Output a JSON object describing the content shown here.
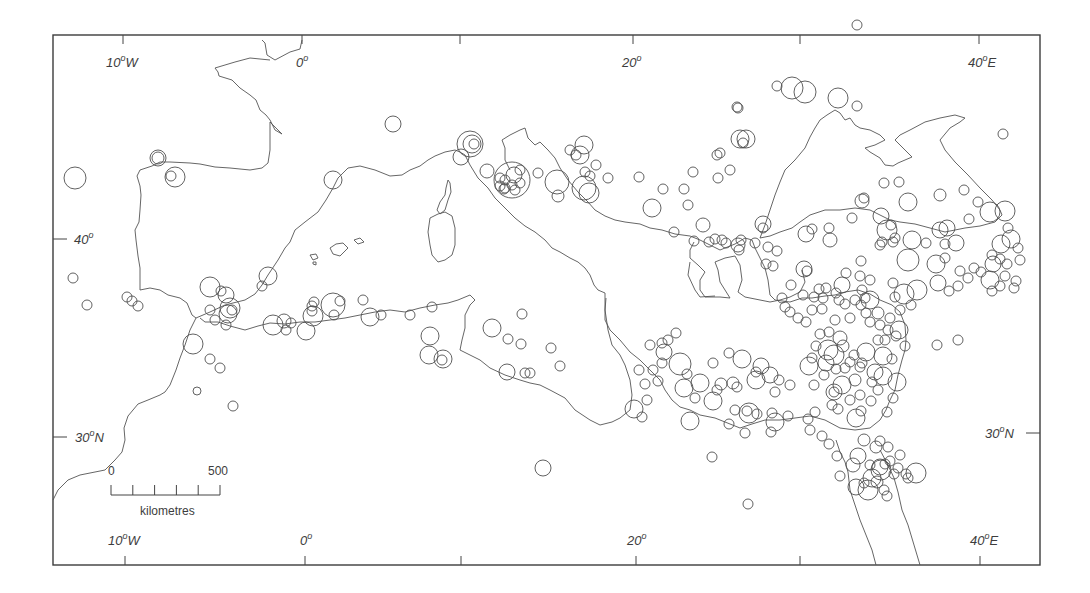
{
  "map": {
    "type": "proportional-symbol map",
    "region": "Mediterranean basin",
    "frame": {
      "x0": 53,
      "y0": 35,
      "x1": 1040,
      "y1": 565
    },
    "longitude_labels_top": [
      {
        "text": "10",
        "suffix": "W",
        "x": 118,
        "tick_x": 123
      },
      {
        "text": "0",
        "suffix": "",
        "x": 298,
        "tick_x": 302
      },
      {
        "text": "",
        "suffix": "",
        "x": 460,
        "tick_x": 460
      },
      {
        "text": "20",
        "suffix": "",
        "x": 625,
        "tick_x": 633
      },
      {
        "text": "",
        "suffix": "",
        "x": 800,
        "tick_x": 800
      },
      {
        "text": "40",
        "suffix": "E",
        "x": 970,
        "tick_x": 979
      }
    ],
    "longitude_labels_bottom": [
      {
        "text": "10",
        "suffix": "W",
        "x": 108,
        "tick_x": 125
      },
      {
        "text": "0",
        "suffix": "",
        "x": 302,
        "tick_x": 305
      },
      {
        "text": "",
        "suffix": "",
        "x": 461,
        "tick_x": 461
      },
      {
        "text": "20",
        "suffix": "",
        "x": 630,
        "tick_x": 636
      },
      {
        "text": "",
        "suffix": "",
        "x": 800,
        "tick_x": 800
      },
      {
        "text": "40",
        "suffix": "E",
        "x": 970,
        "tick_x": 980
      }
    ],
    "latitude_labels_left": [
      {
        "text": "40",
        "suffix": "",
        "y": 239
      },
      {
        "text": "30",
        "suffix": "N",
        "y": 437
      }
    ],
    "latitude_labels_right": [
      {
        "text": "30",
        "suffix": "N",
        "y": 433
      }
    ],
    "degree_symbol": "o",
    "scale_bar": {
      "start_label": "0",
      "end_label": "500",
      "unit_label": "kilometres",
      "x0": 111,
      "x1": 220,
      "y": 495,
      "divisions": 5
    }
  },
  "labels": {
    "top_10w": "10",
    "top_0": "0",
    "top_20": "20",
    "top_40e": "40",
    "bottom_10w": "10",
    "bottom_0": "0",
    "bottom_20": "20",
    "bottom_40e": "40",
    "left_40": "40",
    "left_30n": "30",
    "right_30n": "30",
    "deg": "o",
    "W": "W",
    "E": "E",
    "N": "N",
    "scale_0": "0",
    "scale_500": "500",
    "scale_unit": "kilometres"
  },
  "sites": [
    [
      75,
      178,
      11
    ],
    [
      158,
      158,
      8
    ],
    [
      158,
      158,
      6
    ],
    [
      175,
      177,
      10
    ],
    [
      171,
      176,
      5
    ],
    [
      73,
      278,
      5
    ],
    [
      87,
      305,
      5
    ],
    [
      127,
      297,
      5
    ],
    [
      132,
      301,
      5
    ],
    [
      138,
      306,
      5
    ],
    [
      210,
      287,
      10
    ],
    [
      221,
      291,
      5
    ],
    [
      226,
      295,
      8
    ],
    [
      230,
      308,
      10
    ],
    [
      228,
      314,
      9
    ],
    [
      232,
      310,
      5
    ],
    [
      210,
      310,
      5
    ],
    [
      215,
      320,
      5
    ],
    [
      226,
      325,
      5
    ],
    [
      193,
      344,
      10
    ],
    [
      210,
      359,
      5
    ],
    [
      220,
      368,
      5
    ],
    [
      197,
      391,
      4
    ],
    [
      233,
      406,
      5
    ],
    [
      268,
      276,
      9
    ],
    [
      262,
      286,
      5
    ],
    [
      273,
      325,
      10
    ],
    [
      284,
      321,
      7
    ],
    [
      291,
      323,
      5
    ],
    [
      286,
      330,
      5
    ],
    [
      313,
      316,
      10
    ],
    [
      314,
      302,
      5
    ],
    [
      312,
      306,
      5
    ],
    [
      312,
      311,
      5
    ],
    [
      306,
      331,
      9
    ],
    [
      333,
      305,
      12
    ],
    [
      334,
      315,
      5
    ],
    [
      340,
      301,
      5
    ],
    [
      363,
      300,
      5
    ],
    [
      370,
      317,
      9
    ],
    [
      381,
      315,
      5
    ],
    [
      410,
      315,
      5
    ],
    [
      432,
      307,
      5
    ],
    [
      430,
      336,
      9
    ],
    [
      429,
      355,
      9
    ],
    [
      443,
      359,
      9
    ],
    [
      442,
      360,
      5
    ],
    [
      492,
      328,
      9
    ],
    [
      508,
      339,
      5
    ],
    [
      522,
      314,
      5
    ],
    [
      521,
      344,
      5
    ],
    [
      507,
      372,
      8
    ],
    [
      525,
      373,
      5
    ],
    [
      530,
      373,
      5
    ],
    [
      551,
      348,
      5
    ],
    [
      560,
      366,
      5
    ],
    [
      543,
      468,
      8
    ],
    [
      712,
      457,
      5
    ],
    [
      748,
      504,
      5
    ],
    [
      393,
      124,
      8
    ],
    [
      333,
      180,
      9
    ],
    [
      461,
      157,
      8
    ],
    [
      470,
      144,
      13
    ],
    [
      472,
      144,
      9
    ],
    [
      474,
      144,
      5
    ],
    [
      512,
      180,
      18
    ],
    [
      514,
      175,
      8
    ],
    [
      520,
      170,
      5
    ],
    [
      500,
      178,
      5
    ],
    [
      505,
      180,
      5
    ],
    [
      512,
      185,
      5
    ],
    [
      520,
      183,
      5
    ],
    [
      500,
      186,
      5
    ],
    [
      504,
      189,
      5
    ],
    [
      505,
      188,
      5
    ],
    [
      515,
      190,
      5
    ],
    [
      487,
      171,
      7
    ],
    [
      538,
      173,
      5
    ],
    [
      557,
      182,
      12
    ],
    [
      558,
      196,
      6
    ],
    [
      584,
      145,
      9
    ],
    [
      570,
      150,
      5
    ],
    [
      576,
      155,
      5
    ],
    [
      580,
      155,
      9
    ],
    [
      596,
      165,
      5
    ],
    [
      585,
      172,
      5
    ],
    [
      590,
      176,
      5
    ],
    [
      584,
      188,
      12
    ],
    [
      589,
      193,
      10
    ],
    [
      608,
      178,
      5
    ],
    [
      639,
      177,
      5
    ],
    [
      652,
      208,
      9
    ],
    [
      663,
      189,
      5
    ],
    [
      717,
      155,
      5
    ],
    [
      740,
      139,
      9
    ],
    [
      746,
      139,
      9
    ],
    [
      743,
      143,
      5
    ],
    [
      738,
      108,
      5
    ],
    [
      737,
      107,
      5
    ],
    [
      720,
      153,
      5
    ],
    [
      730,
      170,
      5
    ],
    [
      718,
      178,
      5
    ],
    [
      693,
      172,
      5
    ],
    [
      684,
      189,
      5
    ],
    [
      688,
      205,
      5
    ],
    [
      674,
      232,
      5
    ],
    [
      694,
      241,
      5
    ],
    [
      703,
      225,
      7
    ],
    [
      709,
      242,
      5
    ],
    [
      715,
      239,
      5
    ],
    [
      722,
      240,
      5
    ],
    [
      726,
      243,
      5
    ],
    [
      738,
      245,
      7
    ],
    [
      741,
      240,
      5
    ],
    [
      739,
      250,
      5
    ],
    [
      755,
      243,
      5
    ],
    [
      763,
      224,
      8
    ],
    [
      763,
      228,
      5
    ],
    [
      768,
      247,
      5
    ],
    [
      766,
      264,
      5
    ],
    [
      773,
      266,
      5
    ],
    [
      777,
      251,
      5
    ],
    [
      806,
      234,
      8
    ],
    [
      812,
      229,
      5
    ],
    [
      829,
      228,
      5
    ],
    [
      852,
      218,
      5
    ],
    [
      881,
      216,
      8
    ],
    [
      887,
      230,
      10
    ],
    [
      891,
      225,
      5
    ],
    [
      895,
      238,
      5
    ],
    [
      882,
      242,
      5
    ],
    [
      893,
      242,
      5
    ],
    [
      912,
      240,
      9
    ],
    [
      926,
      243,
      5
    ],
    [
      947,
      228,
      8
    ],
    [
      956,
      243,
      8
    ],
    [
      969,
      219,
      5
    ],
    [
      1001,
      244,
      9
    ],
    [
      1011,
      239,
      9
    ],
    [
      1018,
      248,
      5
    ],
    [
      992,
      255,
      5
    ],
    [
      1000,
      259,
      5
    ],
    [
      1007,
      264,
      5
    ],
    [
      1020,
      260,
      5
    ],
    [
      1005,
      276,
      5
    ],
    [
      1016,
      281,
      5
    ],
    [
      938,
      283,
      8
    ],
    [
      936,
      264,
      9
    ],
    [
      945,
      258,
      5
    ],
    [
      960,
      271,
      5
    ],
    [
      974,
      268,
      5
    ],
    [
      981,
      272,
      5
    ],
    [
      968,
      278,
      5
    ],
    [
      949,
      291,
      5
    ],
    [
      958,
      286,
      5
    ],
    [
      1000,
      286,
      5
    ],
    [
      992,
      291,
      5
    ],
    [
      990,
      280,
      9
    ],
    [
      993,
      264,
      8
    ],
    [
      1008,
      228,
      5
    ],
    [
      1014,
      288,
      5
    ],
    [
      1003,
      134,
      5
    ],
    [
      899,
      182,
      5
    ],
    [
      990,
      212,
      10
    ],
    [
      1005,
      211,
      10
    ],
    [
      940,
      230,
      8
    ],
    [
      945,
      244,
      5
    ],
    [
      862,
      201,
      7
    ],
    [
      864,
      198,
      5
    ],
    [
      857,
      25,
      5
    ],
    [
      777,
      86,
      5
    ],
    [
      792,
      88,
      11
    ],
    [
      805,
      92,
      11
    ],
    [
      838,
      98,
      10
    ],
    [
      857,
      106,
      5
    ],
    [
      884,
      183,
      5
    ],
    [
      908,
      202,
      9
    ],
    [
      940,
      195,
      6
    ],
    [
      964,
      190,
      5
    ],
    [
      978,
      202,
      5
    ],
    [
      908,
      260,
      11
    ],
    [
      880,
      245,
      5
    ],
    [
      893,
      283,
      5
    ],
    [
      895,
      297,
      5
    ],
    [
      937,
      345,
      5
    ],
    [
      958,
      340,
      5
    ],
    [
      904,
      294,
      10
    ],
    [
      917,
      290,
      10
    ],
    [
      861,
      261,
      5
    ],
    [
      830,
      240,
      7
    ],
    [
      804,
      269,
      8
    ],
    [
      807,
      271,
      5
    ],
    [
      846,
      273,
      5
    ],
    [
      842,
      285,
      8
    ],
    [
      862,
      290,
      5
    ],
    [
      870,
      300,
      9
    ],
    [
      880,
      325,
      5
    ],
    [
      890,
      318,
      5
    ],
    [
      888,
      330,
      5
    ],
    [
      866,
      313,
      5
    ],
    [
      878,
      313,
      6
    ],
    [
      870,
      322,
      5
    ],
    [
      885,
      340,
      5
    ],
    [
      899,
      330,
      9
    ],
    [
      900,
      310,
      5
    ],
    [
      911,
      305,
      5
    ],
    [
      896,
      336,
      5
    ],
    [
      829,
      332,
      5
    ],
    [
      791,
      285,
      5
    ],
    [
      782,
      298,
      5
    ],
    [
      785,
      307,
      5
    ],
    [
      790,
      312,
      5
    ],
    [
      798,
      318,
      5
    ],
    [
      806,
      322,
      5
    ],
    [
      803,
      295,
      5
    ],
    [
      814,
      297,
      5
    ],
    [
      819,
      289,
      5
    ],
    [
      823,
      298,
      5
    ],
    [
      826,
      288,
      5
    ],
    [
      836,
      293,
      5
    ],
    [
      839,
      300,
      5
    ],
    [
      845,
      304,
      5
    ],
    [
      855,
      300,
      5
    ],
    [
      861,
      305,
      5
    ],
    [
      865,
      298,
      5
    ],
    [
      870,
      280,
      5
    ],
    [
      860,
      276,
      5
    ],
    [
      812,
      310,
      5
    ],
    [
      822,
      309,
      5
    ],
    [
      835,
      320,
      5
    ],
    [
      850,
      318,
      5
    ],
    [
      820,
      334,
      5
    ],
    [
      840,
      338,
      7
    ],
    [
      843,
      346,
      6
    ],
    [
      854,
      355,
      5
    ],
    [
      866,
      352,
      9
    ],
    [
      862,
      363,
      5
    ],
    [
      875,
      372,
      8
    ],
    [
      883,
      356,
      9
    ],
    [
      878,
      340,
      5
    ],
    [
      892,
      359,
      5
    ],
    [
      905,
      346,
      5
    ],
    [
      850,
      362,
      5
    ],
    [
      855,
      380,
      6
    ],
    [
      860,
      395,
      5
    ],
    [
      871,
      401,
      5
    ],
    [
      878,
      390,
      5
    ],
    [
      872,
      382,
      5
    ],
    [
      893,
      398,
      5
    ],
    [
      887,
      412,
      5
    ],
    [
      897,
      382,
      9
    ],
    [
      883,
      376,
      9
    ],
    [
      834,
      355,
      10
    ],
    [
      828,
      350,
      10
    ],
    [
      826,
      363,
      8
    ],
    [
      836,
      369,
      5
    ],
    [
      845,
      368,
      5
    ],
    [
      860,
      367,
      5
    ],
    [
      842,
      385,
      9
    ],
    [
      834,
      392,
      5
    ],
    [
      850,
      400,
      5
    ],
    [
      861,
      411,
      5
    ],
    [
      856,
      418,
      9
    ],
    [
      822,
      436,
      5
    ],
    [
      834,
      392,
      8
    ],
    [
      824,
      375,
      5
    ],
    [
      814,
      385,
      5
    ],
    [
      790,
      385,
      5
    ],
    [
      779,
      380,
      5
    ],
    [
      775,
      392,
      5
    ],
    [
      770,
      375,
      8
    ],
    [
      809,
      366,
      9
    ],
    [
      812,
      358,
      5
    ],
    [
      816,
      346,
      5
    ],
    [
      756,
      380,
      9
    ],
    [
      756,
      372,
      5
    ],
    [
      749,
      413,
      10
    ],
    [
      747,
      411,
      5
    ],
    [
      745,
      433,
      5
    ],
    [
      757,
      414,
      5
    ],
    [
      772,
      413,
      5
    ],
    [
      742,
      359,
      9
    ],
    [
      729,
      353,
      5
    ],
    [
      721,
      384,
      6
    ],
    [
      717,
      390,
      5
    ],
    [
      713,
      401,
      9
    ],
    [
      700,
      383,
      9
    ],
    [
      695,
      398,
      5
    ],
    [
      684,
      388,
      9
    ],
    [
      687,
      374,
      5
    ],
    [
      680,
      364,
      11
    ],
    [
      668,
      340,
      5
    ],
    [
      676,
      333,
      5
    ],
    [
      662,
      343,
      5
    ],
    [
      664,
      352,
      8
    ],
    [
      662,
      363,
      5
    ],
    [
      650,
      345,
      5
    ],
    [
      639,
      370,
      5
    ],
    [
      645,
      384,
      5
    ],
    [
      634,
      409,
      9
    ],
    [
      642,
      417,
      5
    ],
    [
      647,
      400,
      5
    ],
    [
      658,
      381,
      5
    ],
    [
      653,
      370,
      5
    ],
    [
      690,
      421,
      9
    ],
    [
      713,
      363,
      5
    ],
    [
      729,
      424,
      5
    ],
    [
      735,
      410,
      5
    ],
    [
      737,
      387,
      5
    ],
    [
      733,
      383,
      6
    ],
    [
      761,
      366,
      8
    ],
    [
      775,
      422,
      9
    ],
    [
      771,
      432,
      5
    ],
    [
      788,
      416,
      5
    ],
    [
      808,
      419,
      5
    ],
    [
      810,
      430,
      5
    ],
    [
      815,
      412,
      5
    ],
    [
      832,
      405,
      5
    ],
    [
      838,
      409,
      5
    ],
    [
      876,
      447,
      6
    ],
    [
      858,
      456,
      8
    ],
    [
      853,
      465,
      7
    ],
    [
      856,
      487,
      8
    ],
    [
      877,
      482,
      6
    ],
    [
      880,
      467,
      8
    ],
    [
      885,
      464,
      5
    ],
    [
      868,
      490,
      10
    ],
    [
      884,
      490,
      5
    ],
    [
      894,
      474,
      5
    ],
    [
      900,
      455,
      5
    ],
    [
      906,
      474,
      5
    ],
    [
      881,
      470,
      10
    ],
    [
      864,
      483,
      5
    ],
    [
      870,
      465,
      5
    ],
    [
      872,
      478,
      9
    ],
    [
      887,
      496,
      5
    ],
    [
      898,
      468,
      5
    ],
    [
      916,
      473,
      10
    ],
    [
      908,
      478,
      5
    ],
    [
      840,
      476,
      5
    ],
    [
      829,
      444,
      5
    ],
    [
      837,
      456,
      5
    ],
    [
      864,
      440,
      6
    ],
    [
      888,
      447,
      5
    ],
    [
      890,
      461,
      5
    ],
    [
      880,
      441,
      5
    ]
  ],
  "chart_data": {
    "type": "scatter",
    "title": "",
    "xlabel": "Longitude",
    "ylabel": "Latitude",
    "x_ticks": [
      "10°W",
      "0°",
      "10°E",
      "20°",
      "30°E",
      "40°E"
    ],
    "y_ticks": [
      "40°",
      "30°N"
    ],
    "xlim": [
      -14,
      43
    ],
    "ylim": [
      25,
      50
    ],
    "grid": false,
    "legend": "scale bar: 0–500 kilometres",
    "symbol": "proportional open circles (sites)"
  }
}
